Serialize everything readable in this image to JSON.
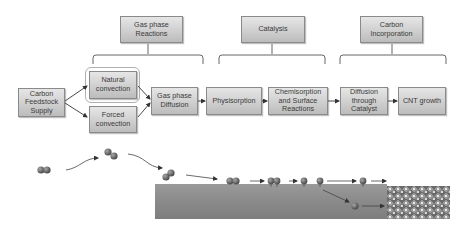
{
  "diagram": {
    "categories": [
      {
        "id": "gas",
        "label": "Gas phase\nReactions"
      },
      {
        "id": "cat",
        "label": "Catalysis"
      },
      {
        "id": "carb",
        "label": "Carbon\nIncorporation"
      }
    ],
    "steps": {
      "feedstock": "Carbon\nFeedstock\nSupply",
      "natural": "Natural\nconvection",
      "forced": "Forced\nconvection",
      "gas_diffusion": "Gas phase\nDiffusion",
      "physisorption": "Physisorption",
      "chemisorption": "Chemisorption\nand Surface\nReactions",
      "diffusion_catalyst": "Diffusion\nthrough\nCatalyst",
      "cnt_growth": "CNT growth"
    },
    "colors": {
      "box_fill_top": "#e6e6e6",
      "box_fill_bottom": "#bcbcbc",
      "box_border": "#8a8a8a",
      "text": "#3a3a3a",
      "molecule": "#6f6f6f",
      "substrate": "#8a8a8a",
      "arrow": "#444444"
    }
  }
}
